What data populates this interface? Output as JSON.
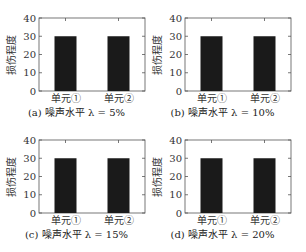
{
  "chart_data": [
    {
      "type": "bar",
      "title": "(a) 噪声水平 λ = 5%",
      "categories": [
        "单元①",
        "单元②"
      ],
      "values": [
        30,
        30
      ],
      "xlabel": "",
      "ylabel": "损伤程度",
      "ylim": [
        0,
        40
      ],
      "yticks": [
        0,
        10,
        20,
        30,
        40
      ],
      "grid": false,
      "bar_color": "#1a1a1a"
    },
    {
      "type": "bar",
      "title": "(b) 噪声水平 λ = 10%",
      "categories": [
        "单元①",
        "单元②"
      ],
      "values": [
        30,
        30
      ],
      "xlabel": "",
      "ylabel": "损伤程度",
      "ylim": [
        0,
        40
      ],
      "yticks": [
        0,
        10,
        20,
        30,
        40
      ],
      "grid": false,
      "bar_color": "#1a1a1a"
    },
    {
      "type": "bar",
      "title": "(c) 噪声水平 λ = 15%",
      "categories": [
        "单元①",
        "单元②"
      ],
      "values": [
        30,
        30
      ],
      "xlabel": "",
      "ylabel": "损伤程度",
      "ylim": [
        0,
        40
      ],
      "yticks": [
        0,
        10,
        20,
        30,
        40
      ],
      "grid": false,
      "bar_color": "#1a1a1a"
    },
    {
      "type": "bar",
      "title": "(d) 噪声水平 λ = 20%",
      "categories": [
        "单元①",
        "单元②"
      ],
      "values": [
        30,
        30
      ],
      "xlabel": "",
      "ylabel": "损伤程度",
      "ylim": [
        0,
        40
      ],
      "yticks": [
        0,
        10,
        20,
        30,
        40
      ],
      "grid": false,
      "bar_color": "#1a1a1a"
    }
  ]
}
